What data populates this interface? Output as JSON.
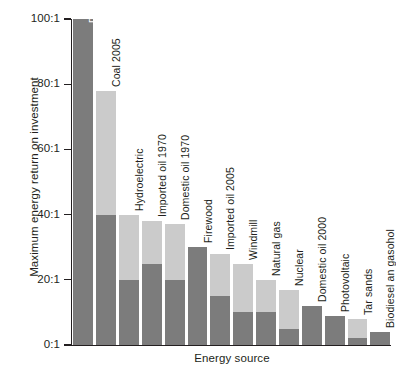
{
  "chart_data": {
    "type": "bar",
    "title": "",
    "subtitle": "",
    "xlabel": "Energy source",
    "ylabel": "Maximum energy return on investment",
    "grid": false,
    "legend": "none",
    "ylim": [
      0,
      100
    ],
    "ytick_labels": [
      "100:1",
      "80:1",
      "60:1",
      "40:1",
      "20:1",
      "0:1"
    ],
    "ytick_values": [
      100,
      80,
      60,
      40,
      20,
      0
    ],
    "tick_suffix": ":1",
    "stacked": true,
    "categories": [
      "Domestic oil 1930",
      "Coal 2005",
      "Hydroelectric",
      "Imported oil 1970",
      "Domestic oil 1970",
      "Firewood",
      "Imported oil 2005",
      "Windmill",
      "Natural gas",
      "Nuclear",
      "Domestic oil 2000",
      "Photovoltaic",
      "Tar sands",
      "Biodiesel an gasohol"
    ],
    "values": [
      100,
      78,
      40,
      38,
      37,
      30,
      28,
      25,
      20,
      17,
      12,
      9,
      8,
      4
    ],
    "series": [
      {
        "name": "lower estimate",
        "color": "#7c7c7c",
        "values": [
          100,
          40,
          20,
          25,
          20,
          30,
          15,
          10,
          10,
          5,
          12,
          9,
          2,
          4
        ]
      },
      {
        "name": "upper estimate",
        "color": "#cbcbcb",
        "values": [
          0,
          38,
          20,
          13,
          17,
          0,
          13,
          15,
          10,
          12,
          0,
          0,
          6,
          0
        ]
      }
    ],
    "label_placement": [
      "inside",
      "outside",
      "outside",
      "outside",
      "outside",
      "outside",
      "outside",
      "outside",
      "outside",
      "outside",
      "outside",
      "outside",
      "outside",
      "outside"
    ]
  },
  "colors": {
    "dark_bar": "#7c7c7c",
    "light_bar": "#cbcbcb",
    "axis": "#231f20",
    "text": "#231f20",
    "inside_label": "#ffffff",
    "background": "#ffffff"
  }
}
